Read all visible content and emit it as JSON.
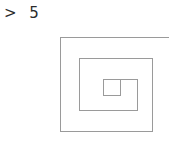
{
  "prompt": {
    "symbol": ">",
    "value": "5",
    "full_text": "> 5"
  },
  "drawing": {
    "name": "square-spiral",
    "shape_type": "square-spiral",
    "turns": 3,
    "line_color": "#9a9a9a",
    "background_color": "#ffffff",
    "text_color": "#2b2b2b",
    "stroke_width": 1,
    "clipped_at_right_edge": true,
    "path": "M 169 37 L 60.5 37 L 60.5 131 L 152 131 L 152 58 L 79 58 L 79 110.5 L 137 110.5 L 137 79 L 103.5 79 L 103.5 95.5 L 120.5 95.5 L 120.5 79.5",
    "rings": [
      {
        "label": "outer-ring",
        "left": 60.5,
        "top": 37,
        "right": 152,
        "bottom": 131
      },
      {
        "label": "middle-ring",
        "left": 79,
        "top": 58,
        "right": 137,
        "bottom": 110.5
      },
      {
        "label": "inner-ring",
        "left": 103.5,
        "top": 79,
        "right": 120.5,
        "bottom": 95.5
      }
    ]
  },
  "canvas": {
    "width": 169,
    "height": 145
  }
}
